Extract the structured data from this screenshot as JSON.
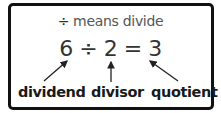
{
  "title": {
    "symbol": "÷",
    "text": "means divide"
  },
  "equation": "6 ÷ 2 = 3",
  "labels": {
    "dividend": "dividend",
    "divisor": "divisor",
    "quotient": "quotient"
  },
  "colors": {
    "border": "#111111",
    "text": "#333333"
  }
}
